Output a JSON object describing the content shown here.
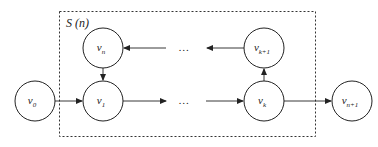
{
  "diagram": {
    "boundary_label": "S (n)",
    "nodes": [
      {
        "id": "v0",
        "base": "v",
        "sub": "0",
        "cx": 35,
        "cy": 101
      },
      {
        "id": "v1",
        "base": "v",
        "sub": "1",
        "cx": 103,
        "cy": 101
      },
      {
        "id": "vn",
        "base": "v",
        "sub": "n",
        "cx": 103,
        "cy": 48
      },
      {
        "id": "vk",
        "base": "v",
        "sub": "k",
        "cx": 264,
        "cy": 101
      },
      {
        "id": "vk1",
        "base": "v",
        "sub": "k+1",
        "cx": 264,
        "cy": 48
      },
      {
        "id": "vn1",
        "base": "v",
        "sub": "n+1",
        "cx": 352,
        "cy": 101
      }
    ],
    "ellipsis_top": "…",
    "ellipsis_bottom": "…",
    "edges": [
      {
        "from": "v0",
        "to": "v1"
      },
      {
        "from": "vn",
        "to": "v1"
      },
      {
        "from": "v1",
        "to": "ellipsis_bottom"
      },
      {
        "from": "ellipsis_bottom",
        "to": "vk"
      },
      {
        "from": "vk",
        "to": "vk1"
      },
      {
        "from": "vk1",
        "to": "ellipsis_top"
      },
      {
        "from": "ellipsis_top",
        "to": "vn"
      },
      {
        "from": "vk",
        "to": "vn1"
      }
    ],
    "colors": {
      "stroke": "#222222",
      "background": "#ffffff"
    }
  },
  "caption": {
    "text": ""
  }
}
